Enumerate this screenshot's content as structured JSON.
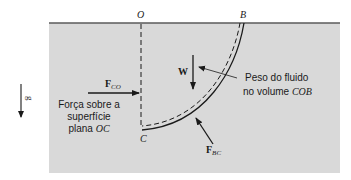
{
  "diagram": {
    "colors": {
      "fluid": "#d9d9d9",
      "surface_line": "#5a5a5a",
      "ink": "#1a1a1a",
      "background": "#ffffff"
    },
    "labels": {
      "point_o": "O",
      "point_b": "B",
      "point_c": "C",
      "gravity": "g",
      "weight": "W",
      "f_co_main": "F",
      "f_co_sub": "CO",
      "f_bc_main": "F",
      "f_bc_sub": "BC"
    },
    "annotations": {
      "weight_note_line1": "Peso do fluido",
      "weight_note_line2_prefix": "no volume ",
      "weight_note_line2_var": "COB",
      "force_note_line1": "Força sobre a",
      "force_note_line2": "superfície",
      "force_note_line3_prefix": "plana ",
      "force_note_line3_var": "OC"
    }
  }
}
